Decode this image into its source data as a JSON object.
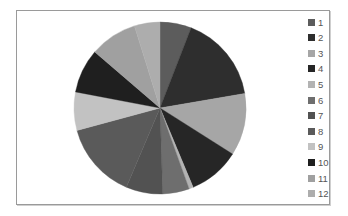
{
  "chart_data": {
    "type": "pie",
    "title": "",
    "categories": [
      "1",
      "2",
      "3",
      "4",
      "5",
      "6",
      "7",
      "8",
      "9",
      "10",
      "11",
      "12"
    ],
    "values": [
      5.9,
      16.4,
      11.7,
      9.7,
      0.8,
      5.0,
      6.9,
      14.4,
      7.2,
      8.3,
      8.9,
      4.8
    ],
    "colors": [
      "#5c5c5c",
      "#2e2e2e",
      "#a6a6a6",
      "#262626",
      "#b3b3b3",
      "#6e6e6e",
      "#525252",
      "#5a5a5a",
      "#c2c2c2",
      "#1f1f1f",
      "#a0a0a0",
      "#adadad"
    ],
    "start_angle_deg": 0,
    "direction": "clockwise",
    "legend_position": "right",
    "units": "percent (estimated)"
  },
  "legend": {
    "items": [
      {
        "label": "1"
      },
      {
        "label": "2"
      },
      {
        "label": "3"
      },
      {
        "label": "4"
      },
      {
        "label": "5"
      },
      {
        "label": "6"
      },
      {
        "label": "7"
      },
      {
        "label": "8"
      },
      {
        "label": "9"
      },
      {
        "label": "10"
      },
      {
        "label": "11"
      },
      {
        "label": "12"
      }
    ]
  }
}
